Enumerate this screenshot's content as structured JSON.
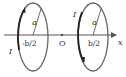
{
  "diagram": {
    "type": "physics-coaxial-current-loops",
    "axis": {
      "label": "x",
      "origin_label": "O"
    },
    "loops": [
      {
        "position_label": "-b/2",
        "radius_label": "a",
        "current_label": "I",
        "current_direction": "upward on front edge"
      },
      {
        "position_label": "b/2",
        "radius_label": "a",
        "current_label": "I",
        "current_direction": "downward on front edge"
      }
    ],
    "colors": {
      "loop": "#555555",
      "loop_front": "#222222",
      "axis": "#555555",
      "text": "#333333"
    }
  }
}
